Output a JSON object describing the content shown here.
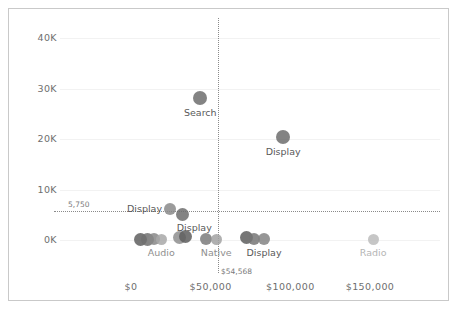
{
  "chart_data": {
    "type": "scatter",
    "title": "",
    "xlabel": "",
    "ylabel": "",
    "xlim": [
      -18000,
      190000
    ],
    "ylim": [
      -3500,
      44000
    ],
    "grid": false,
    "legend": "none",
    "x_ticks": [
      {
        "value": 0,
        "label": "$0"
      },
      {
        "value": 50000,
        "label": "$50,000"
      },
      {
        "value": 100000,
        "label": "$100,000"
      },
      {
        "value": 150000,
        "label": "$150,000"
      }
    ],
    "y_ticks": [
      {
        "value": 0,
        "label": "0K"
      },
      {
        "value": 10000,
        "label": "10K"
      },
      {
        "value": 20000,
        "label": "20K"
      },
      {
        "value": 30000,
        "label": "30K"
      },
      {
        "value": 40000,
        "label": "40K"
      }
    ],
    "reference_lines": [
      {
        "orientation": "horizontal",
        "value": 5750,
        "label": "5,750",
        "style": "dotted"
      },
      {
        "orientation": "vertical",
        "value": 54568,
        "label": "$54,568",
        "style": "dotted"
      }
    ],
    "points": [
      {
        "name": "search-point",
        "x": 43500,
        "y": 28100,
        "r": 7.0,
        "color": "#6d6d6d",
        "label": "Search",
        "label_pos": "below",
        "label_color": "#595959"
      },
      {
        "name": "display-high-point",
        "x": 95500,
        "y": 20300,
        "r": 7.0,
        "color": "#6d6d6d",
        "label": "Display",
        "label_pos": "below",
        "label_color": "#595959"
      },
      {
        "name": "display-ref-point-a",
        "x": 24500,
        "y": 6050,
        "r": 6.0,
        "color": "#8a8a8a",
        "label": "Display",
        "label_pos": "left",
        "label_color": "#595959"
      },
      {
        "name": "display-ref-point-b",
        "x": 32500,
        "y": 5100,
        "r": 6.5,
        "color": "#6d6d6d",
        "label": "Display",
        "label_pos": "belowright",
        "label_color": "#595959"
      },
      {
        "name": "audio-point-1",
        "x": 6000,
        "y": 150,
        "r": 6.5,
        "color": "#5f5f5f",
        "label": "",
        "label_pos": "none",
        "label_color": "#8f8f8f"
      },
      {
        "name": "audio-point-2",
        "x": 10500,
        "y": 100,
        "r": 6.5,
        "color": "#707070",
        "label": "",
        "label_pos": "none",
        "label_color": "#8f8f8f"
      },
      {
        "name": "audio-point-3",
        "x": 14500,
        "y": 120,
        "r": 6.0,
        "color": "#878787",
        "label": "",
        "label_pos": "none",
        "label_color": "#8f8f8f"
      },
      {
        "name": "audio-point-4",
        "x": 19000,
        "y": 80,
        "r": 5.5,
        "color": "#a8a8a8",
        "label": "Audio",
        "label_pos": "below",
        "label_color": "#8f8f8f"
      },
      {
        "name": "native-point-1",
        "x": 30500,
        "y": 520,
        "r": 6.5,
        "color": "#8e8e8e",
        "label": "",
        "label_pos": "none",
        "label_color": "#8f8f8f"
      },
      {
        "name": "native-point-2",
        "x": 34500,
        "y": 700,
        "r": 6.5,
        "color": "#5e5e5e",
        "label": "",
        "label_pos": "none",
        "label_color": "#8f8f8f"
      },
      {
        "name": "native-point-3",
        "x": 47000,
        "y": 120,
        "r": 6.0,
        "color": "#7b7b7b",
        "label": "",
        "label_pos": "none",
        "label_color": "#8f8f8f"
      },
      {
        "name": "native-point-4",
        "x": 53500,
        "y": 60,
        "r": 5.5,
        "color": "#a2a2a2",
        "label": "Native",
        "label_pos": "below",
        "label_color": "#8f8f8f"
      },
      {
        "name": "display-low-point-1",
        "x": 72500,
        "y": 420,
        "r": 6.5,
        "color": "#5e5e5e",
        "label": "",
        "label_pos": "none",
        "label_color": "#8f8f8f"
      },
      {
        "name": "display-low-point-2",
        "x": 77500,
        "y": 260,
        "r": 6.0,
        "color": "#767676",
        "label": "",
        "label_pos": "none",
        "label_color": "#8f8f8f"
      },
      {
        "name": "display-low-point-3",
        "x": 83500,
        "y": 120,
        "r": 6.0,
        "color": "#848484",
        "label": "Display",
        "label_pos": "below",
        "label_color": "#595959"
      },
      {
        "name": "radio-point",
        "x": 152000,
        "y": 120,
        "r": 5.5,
        "color": "#bcbcbc",
        "label": "Radio",
        "label_pos": "below",
        "label_color": "#b5b5b5"
      }
    ]
  }
}
